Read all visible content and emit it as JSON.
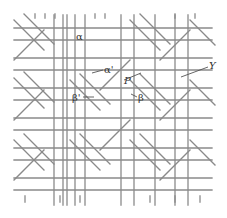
{
  "figure": {
    "type": "woven-lattice-diagram",
    "line_color": "#8a8a8a",
    "background": "#ffffff",
    "labels": {
      "alpha": "α",
      "alpha_prime": "α'",
      "beta": "β",
      "beta_prime": "β'",
      "p": "P",
      "y": "Y"
    }
  }
}
